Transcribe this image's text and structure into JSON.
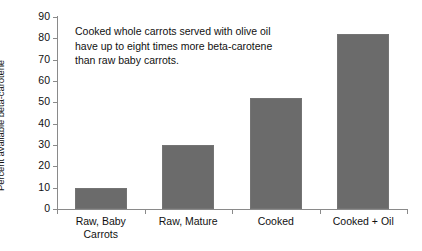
{
  "chart_data": {
    "type": "bar",
    "title": "",
    "subtitle": "",
    "xlabel": "",
    "ylabel": "Percent available beta-carotene",
    "categories": [
      "Raw, Baby\nCarrots",
      "Raw, Mature",
      "Cooked",
      "Cooked + Oil"
    ],
    "values": [
      10,
      30,
      52,
      82
    ],
    "ylim": [
      0,
      90
    ],
    "ytick_labels": [
      "0",
      "10",
      "20",
      "30",
      "40",
      "50",
      "60",
      "70",
      "80",
      "90"
    ],
    "ytick_values": [
      0,
      10,
      20,
      30,
      40,
      50,
      60,
      70,
      80,
      90
    ],
    "grid": false,
    "legend": false,
    "legend_position": "none",
    "annotations": [
      "Cooked whole carrots served with olive oil\nhave up to eight times more beta-carotene\nthan raw baby carrots."
    ],
    "bar_color": "#6b6b6b",
    "axis_color": "#8a8a8a",
    "background_color": "#ffffff"
  }
}
